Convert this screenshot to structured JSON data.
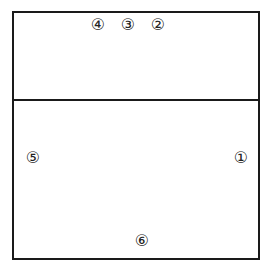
{
  "diagram": {
    "type": "volleyball-court-rotation",
    "colors": {
      "line": "#1a1a1a",
      "text": "#222222",
      "background": "#ffffff"
    },
    "positions": [
      {
        "id": 1,
        "label": "①",
        "x": 241,
        "y": 158,
        "zone": "back-right"
      },
      {
        "id": 2,
        "label": "②",
        "x": 158,
        "y": 25,
        "zone": "front-right"
      },
      {
        "id": 3,
        "label": "③",
        "x": 128,
        "y": 25,
        "zone": "front-middle"
      },
      {
        "id": 4,
        "label": "④",
        "x": 98,
        "y": 25,
        "zone": "front-left"
      },
      {
        "id": 5,
        "label": "⑤",
        "x": 33,
        "y": 158,
        "zone": "back-left"
      },
      {
        "id": 6,
        "label": "⑥",
        "x": 142,
        "y": 241,
        "zone": "back-middle"
      }
    ]
  }
}
